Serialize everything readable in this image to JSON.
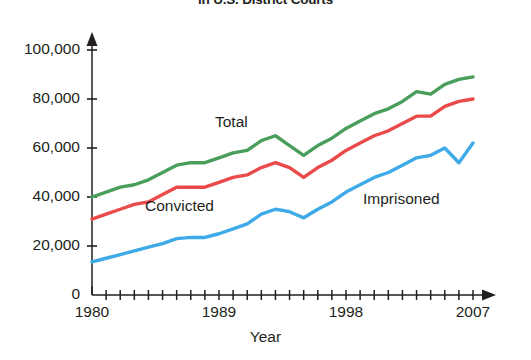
{
  "title": "in U.S. District Courts",
  "axes": {
    "x_title": "Year",
    "x_ticks": [
      "1980",
      "1989",
      "1998",
      "2007"
    ],
    "y_ticks": [
      "0",
      "20,000",
      "40,000",
      "60,000",
      "80,000",
      "100,000"
    ]
  },
  "series_labels": {
    "total": "Total",
    "convicted": "Convicted",
    "imprisoned": "Imprisoned"
  },
  "colors": {
    "total": "#4a9e5c",
    "convicted": "#ea4a4a",
    "imprisoned": "#3eabe8",
    "axis": "#58595b",
    "text": "#231f20"
  },
  "chart_data": {
    "type": "line",
    "title": "in U.S. District Courts",
    "xlabel": "Year",
    "ylabel": "",
    "xlim": [
      1980,
      2007
    ],
    "ylim": [
      0,
      100000
    ],
    "grid": false,
    "legend": "inline-labels",
    "x": [
      1980,
      1981,
      1982,
      1983,
      1984,
      1985,
      1986,
      1987,
      1988,
      1989,
      1990,
      1991,
      1992,
      1993,
      1994,
      1995,
      1996,
      1997,
      1998,
      1999,
      2000,
      2001,
      2002,
      2003,
      2004,
      2005,
      2006,
      2007
    ],
    "series": [
      {
        "name": "Total",
        "color": "#4a9e5c",
        "values": [
          40000,
          42000,
          44000,
          45000,
          47000,
          50000,
          53000,
          54000,
          54000,
          56000,
          58000,
          59000,
          63000,
          65000,
          61000,
          57000,
          61000,
          64000,
          68000,
          71000,
          74000,
          76000,
          79000,
          83000,
          82000,
          86000,
          88000,
          89000
        ]
      },
      {
        "name": "Convicted",
        "color": "#ea4a4a",
        "values": [
          31000,
          33000,
          35000,
          37000,
          38000,
          41000,
          44000,
          44000,
          44000,
          46000,
          48000,
          49000,
          52000,
          54000,
          52000,
          48000,
          52000,
          55000,
          59000,
          62000,
          65000,
          67000,
          70000,
          73000,
          73000,
          77000,
          79000,
          80000
        ]
      },
      {
        "name": "Imprisoned",
        "color": "#3eabe8",
        "values": [
          13500,
          15000,
          16500,
          18000,
          19500,
          21000,
          23000,
          23500,
          23500,
          25000,
          27000,
          29000,
          33000,
          35000,
          34000,
          31500,
          35000,
          38000,
          42000,
          45000,
          48000,
          50000,
          53000,
          56000,
          57000,
          60000,
          54000,
          62000
        ]
      }
    ]
  }
}
